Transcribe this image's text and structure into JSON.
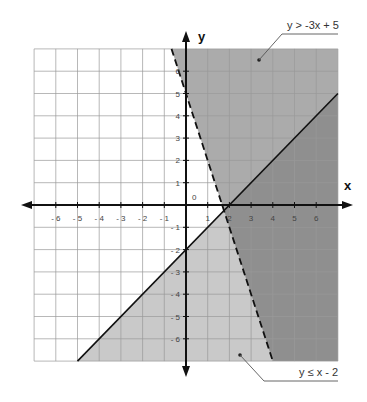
{
  "chart_data": {
    "type": "inequality-graph",
    "title": "",
    "xlabel": "x",
    "ylabel": "y",
    "xlim": [
      -7,
      7
    ],
    "ylim": [
      -7,
      7
    ],
    "grid": true,
    "x_ticks": [
      "-6",
      "-5",
      "-4",
      "-3",
      "-2",
      "-1",
      "1",
      "2",
      "3",
      "4",
      "5",
      "6"
    ],
    "y_ticks": [
      "6",
      "5",
      "4",
      "3",
      "2",
      "1",
      "-1",
      "-2",
      "-3",
      "-4",
      "-5",
      "-6"
    ],
    "origin_label": "0",
    "series": [
      {
        "name": "y > -3x + 5",
        "boundary": "y = -3x + 5",
        "slope": -3,
        "intercept": 5,
        "line_style": "dashed",
        "shaded_side": "above",
        "fill": "#aaaaaa"
      },
      {
        "name": "y ≤ x - 2",
        "boundary": "y = x - 2",
        "slope": 1,
        "intercept": -2,
        "line_style": "solid",
        "shaded_side": "below",
        "fill": "#c8c8c8"
      }
    ],
    "overlap_fill": "#8f8f8f",
    "annotations": [
      {
        "text": "y > -3x + 5",
        "position": "top-right"
      },
      {
        "text": "y ≤ x - 2",
        "position": "bottom-right"
      }
    ]
  },
  "labels": {
    "x_axis": "x",
    "y_axis": "y",
    "origin": "0",
    "callout_top": "y > -3x + 5",
    "callout_bottom": "y ≤ x - 2",
    "xticks": [
      "-6",
      "-5",
      "-4",
      "-3",
      "-2",
      "-1",
      "1",
      "2",
      "3",
      "4",
      "5",
      "6"
    ],
    "yticks": [
      "6",
      "5",
      "4",
      "3",
      "2",
      "1",
      "-1",
      "-2",
      "-3",
      "-4",
      "-5",
      "-6"
    ]
  }
}
